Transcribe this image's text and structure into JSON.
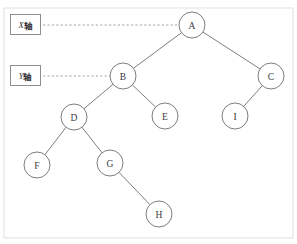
{
  "figure": {
    "type": "binary-tree-diagram",
    "background_color": "#ffffff",
    "stroke_color": "#6e6e72",
    "dashed_color": "#9a9a9e",
    "frame_color": "#d8d8dc",
    "top_artifact_text": "",
    "frame": {
      "x": 4,
      "y": 8,
      "width": 289,
      "height": 230
    }
  },
  "annotations": {
    "boxes": [
      {
        "id": "x-axis-box",
        "letter": "X",
        "word": "轴",
        "full_text": "X轴",
        "x": 10,
        "y": 14,
        "width": 31,
        "height": 21,
        "connects_to": "A"
      },
      {
        "id": "y-axis-box",
        "letter": "Y",
        "word": "轴",
        "full_text": "Y轴",
        "x": 10,
        "y": 65,
        "width": 31,
        "height": 21,
        "connects_to": "B"
      }
    ],
    "dashed_connectors": [
      {
        "id": "x-connector",
        "x1": 43,
        "y1": 25,
        "x2": 179,
        "y2": 25
      },
      {
        "id": "y-connector",
        "x1": 43,
        "y1": 76,
        "x2": 110,
        "y2": 76
      }
    ]
  },
  "tree": {
    "root": "A",
    "node_radius": 13,
    "nodes": [
      {
        "id": "A",
        "label": "A",
        "cx": 192,
        "cy": 25
      },
      {
        "id": "B",
        "label": "B",
        "cx": 123,
        "cy": 76
      },
      {
        "id": "C",
        "label": "C",
        "cx": 271,
        "cy": 76
      },
      {
        "id": "D",
        "label": "D",
        "cx": 74,
        "cy": 117
      },
      {
        "id": "E",
        "label": "E",
        "cx": 165,
        "cy": 116
      },
      {
        "id": "I",
        "label": "I",
        "cx": 235,
        "cy": 116
      },
      {
        "id": "F",
        "label": "F",
        "cx": 37,
        "cy": 165
      },
      {
        "id": "G",
        "label": "G",
        "cx": 110,
        "cy": 163
      },
      {
        "id": "H",
        "label": "H",
        "cx": 159,
        "cy": 214
      }
    ],
    "edges": [
      {
        "from": "A",
        "to": "B"
      },
      {
        "from": "A",
        "to": "C"
      },
      {
        "from": "B",
        "to": "D"
      },
      {
        "from": "B",
        "to": "E"
      },
      {
        "from": "C",
        "to": "I"
      },
      {
        "from": "D",
        "to": "F"
      },
      {
        "from": "D",
        "to": "G"
      },
      {
        "from": "G",
        "to": "H"
      }
    ]
  }
}
